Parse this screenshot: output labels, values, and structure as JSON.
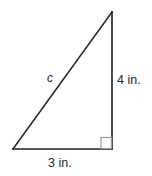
{
  "figure": {
    "type": "right-triangle-diagram",
    "background_color": "#ffffff",
    "stroke_color": "#231f20",
    "right_angle_color": "#8c8c8c",
    "labels": {
      "hypotenuse": "c",
      "vertical_leg": "4 in.",
      "horizontal_leg": "3 in."
    },
    "geometry": {
      "vertex_bottom_left": [
        13,
        149
      ],
      "vertex_bottom_right": [
        112,
        149
      ],
      "vertex_top_right": [
        112,
        12
      ],
      "right_angle_marker": {
        "x": 101,
        "y": 137,
        "size": 11
      }
    },
    "measurements": {
      "horizontal_leg_length": 3,
      "vertical_leg_length": 4,
      "units": "in.",
      "hypotenuse_label": "c"
    }
  }
}
